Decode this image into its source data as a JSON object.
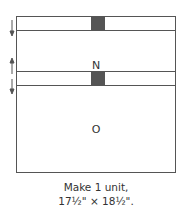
{
  "diagram": {
    "units": [
      {
        "label": "",
        "type": "strip",
        "has_center_square": true
      },
      {
        "label": "N",
        "type": "block"
      },
      {
        "label": "",
        "type": "strip",
        "has_center_square": true
      },
      {
        "label": "O",
        "type": "block"
      }
    ],
    "arrows": [
      "down",
      "up",
      "down"
    ],
    "colors": {
      "outline": "#555555",
      "square_fill": "#555555"
    }
  },
  "caption": {
    "line1": "Make 1 unit,",
    "line2": "17½\" × 18½\"."
  }
}
